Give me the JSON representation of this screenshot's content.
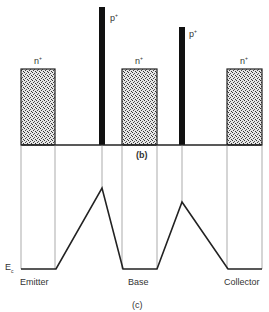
{
  "diagram": {
    "panel_b": {
      "caption": "(b)",
      "doping_labels": {
        "n_left": "n",
        "n_mid": "n",
        "n_right": "n",
        "p_left": "p",
        "p_right": "p",
        "n_sup": "+",
        "p_sup": "+"
      }
    },
    "panel_c": {
      "caption": "(c)",
      "energy_label": "E",
      "energy_sub": "c",
      "regions": [
        "Emitter",
        "Base",
        "Collector"
      ]
    }
  }
}
